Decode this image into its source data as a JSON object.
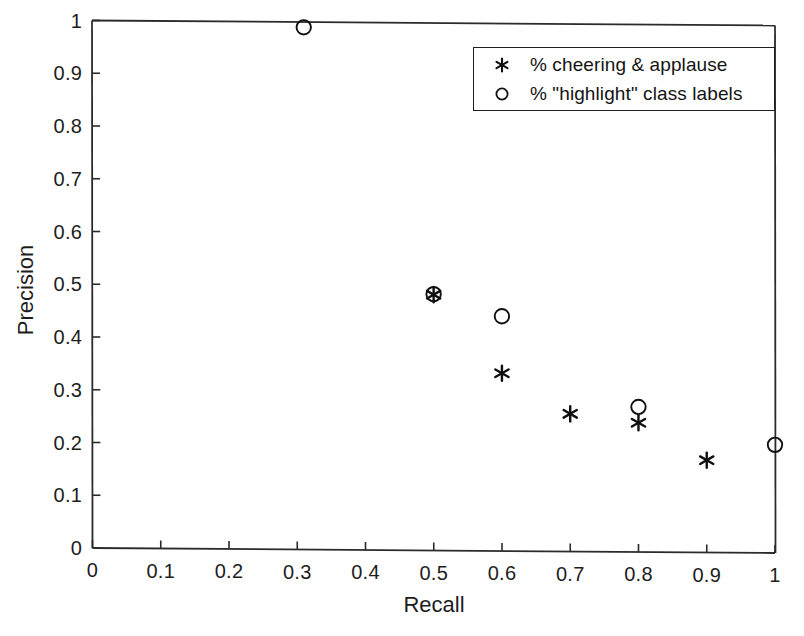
{
  "chart_data": {
    "type": "scatter",
    "title": "",
    "xlabel": "Recall",
    "ylabel": "Precision",
    "xlim": [
      0,
      1
    ],
    "ylim": [
      0,
      1
    ],
    "grid": false,
    "legend_position": "top-right",
    "xticks": [
      "0",
      "0.1",
      "0.2",
      "0.3",
      "0.4",
      "0.5",
      "0.6",
      "0.7",
      "0.8",
      "0.9",
      "1"
    ],
    "xtick_values": [
      0,
      0.1,
      0.2,
      0.3,
      0.4,
      0.5,
      0.6,
      0.7,
      0.8,
      0.9,
      1
    ],
    "yticks": [
      "0",
      "0.1",
      "0.2",
      "0.3",
      "0.4",
      "0.5",
      "0.6",
      "0.7",
      "0.8",
      "0.9",
      "1"
    ],
    "ytick_values": [
      0,
      0.1,
      0.2,
      0.3,
      0.4,
      0.5,
      0.6,
      0.7,
      0.8,
      0.9,
      1
    ],
    "series": [
      {
        "name": "% cheering & applause",
        "marker": "asterisk",
        "color": "#101010",
        "points": [
          {
            "x": 0.5,
            "y": 0.485
          },
          {
            "x": 0.6,
            "y": 0.337
          },
          {
            "x": 0.7,
            "y": 0.261
          },
          {
            "x": 0.8,
            "y": 0.245
          },
          {
            "x": 0.9,
            "y": 0.175
          }
        ]
      },
      {
        "name": "% \"highlight\" class labels",
        "marker": "circle",
        "color": "#101010",
        "points": [
          {
            "x": 0.31,
            "y": 0.99
          },
          {
            "x": 0.5,
            "y": 0.486
          },
          {
            "x": 0.6,
            "y": 0.445
          },
          {
            "x": 0.8,
            "y": 0.275
          },
          {
            "x": 1.0,
            "y": 0.205
          }
        ]
      }
    ]
  },
  "legend": {
    "entries": [
      {
        "symbol": "asterisk",
        "label": "% cheering & applause"
      },
      {
        "symbol": "circle",
        "label": "% \"highlight\" class labels"
      }
    ]
  },
  "axes": {
    "x_title": "Recall",
    "y_title": "Precision"
  },
  "colors": {
    "background": "#ffffff",
    "axis": "#2b2b2b",
    "marker": "#101010",
    "text": "#1d1d1d"
  }
}
